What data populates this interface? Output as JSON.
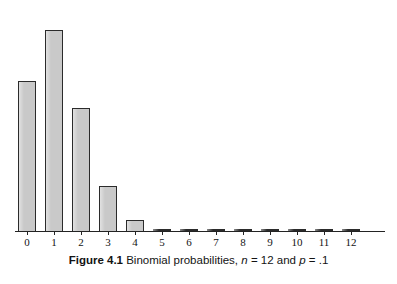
{
  "figure": {
    "caption_label": "Figure 4.1",
    "caption_text": "Binomial probabilities,",
    "caption_var_n": "n",
    "caption_eq1": "= 12 and",
    "caption_var_p": "p",
    "caption_eq2": "= .1"
  },
  "colors": {
    "bar_fill": "#c9c9c9",
    "bar_stroke": "#2b2b2b",
    "axis": "#232323",
    "text": "#131313",
    "background": "#ffffff"
  },
  "chart_data": {
    "type": "bar",
    "title": "Figure 4.1 Binomial probabilities, n = 12 and p = .1",
    "subtitle": "",
    "xlabel": "",
    "ylabel": "",
    "categories": [
      "0",
      "1",
      "2",
      "3",
      "4",
      "5",
      "6",
      "7",
      "8",
      "9",
      "10",
      "11",
      "12"
    ],
    "values": [
      0.2824,
      0.3766,
      0.2301,
      0.0852,
      0.0213,
      0.0038,
      0.0005,
      5e-05,
      4e-06,
      2e-07,
      1e-08,
      3e-10,
      1e-12
    ],
    "ylim": [
      0,
      0.4
    ],
    "xlim_categories": [
      "0",
      "12"
    ],
    "grid": false,
    "legend": false,
    "legend_position": "none",
    "parameters": {
      "n": 12,
      "p": 0.1
    },
    "annotations": []
  },
  "axis": {
    "tick_labels": [
      "0",
      "1",
      "2",
      "3",
      "4",
      "5",
      "6",
      "7",
      "8",
      "9",
      "10",
      "11",
      "12"
    ]
  }
}
